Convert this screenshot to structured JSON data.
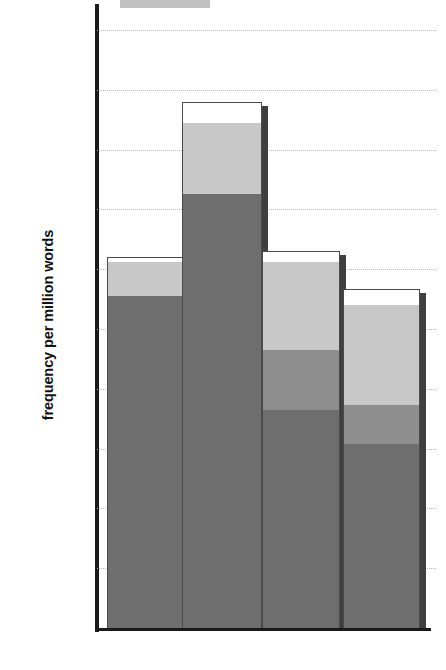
{
  "chart_data": {
    "type": "bar",
    "title": "",
    "xlabel": "",
    "ylabel": "frequency per million words",
    "categories": [
      "CONV",
      "FICT",
      "NEWS",
      "ACAD"
    ],
    "ylim": [
      0,
      20000
    ],
    "ytick_values": [
      0,
      2000,
      4000,
      6000,
      8000,
      10000,
      12000,
      14000,
      16000,
      18000,
      20000
    ],
    "ytick_labels": [
      "0",
      "2000",
      "4000",
      "6000",
      "8000",
      "10000",
      "12000",
      "14000",
      "16000",
      "18000",
      "20000"
    ],
    "grid": true,
    "stacked": true,
    "legend": "none",
    "series": [
      {
        "name": "segment-1-dark",
        "color": "#6e6e6e",
        "values": [
          11100,
          14500,
          7300,
          6150
        ]
      },
      {
        "name": "segment-2-medium",
        "color": "#8e8e8e",
        "values": [
          0,
          0,
          2000,
          1300
        ]
      },
      {
        "name": "segment-3-light",
        "color": "#c8c8c8",
        "values": [
          1150,
          2400,
          2950,
          3350
        ]
      },
      {
        "name": "segment-4-white",
        "color": "#ffffff",
        "values": [
          150,
          700,
          350,
          550
        ]
      }
    ],
    "totals": [
      12400,
      17600,
      12600,
      11350
    ],
    "cumulative_tops": {
      "CONV": [
        11100,
        11100,
        12250,
        12400
      ],
      "FICT": [
        14500,
        14500,
        16900,
        17600
      ],
      "NEWS": [
        7300,
        9300,
        12250,
        12600
      ],
      "ACAD": [
        6150,
        7450,
        10800,
        11350
      ]
    }
  },
  "axis": {
    "y_title": "frequency per million words"
  },
  "colors": {
    "dark": "#6e6e6e",
    "medium": "#8e8e8e",
    "light": "#c8c8c8",
    "white": "#ffffff",
    "outline": "#4a4a4a",
    "axis": "#1a1a1a",
    "grid": "#b9b9b9"
  }
}
